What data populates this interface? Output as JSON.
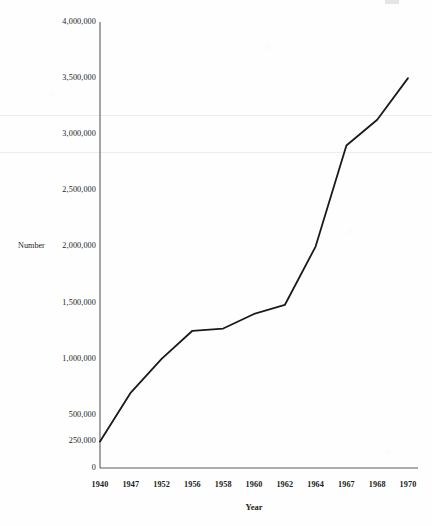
{
  "chart_data": {
    "type": "line",
    "title": "",
    "xlabel": "Year",
    "ylabel": "Number",
    "categories": [
      "1940",
      "1947",
      "1952",
      "1956",
      "1958",
      "1960",
      "1962",
      "1964",
      "1967",
      "1968",
      "1970"
    ],
    "values": [
      250000,
      700000,
      1000000,
      1250000,
      1270000,
      1400000,
      1480000,
      2000000,
      2900000,
      3130000,
      3500000
    ],
    "series": [
      {
        "name": "Number",
        "values": [
          250000,
          700000,
          1000000,
          1250000,
          1270000,
          1400000,
          1480000,
          2000000,
          2900000,
          3130000,
          3500000
        ]
      }
    ],
    "ylim": [
      0,
      4000000
    ],
    "ytick_values": [
      0,
      250000,
      500000,
      1000000,
      1500000,
      2000000,
      2500000,
      3000000,
      3500000,
      4000000
    ],
    "ytick_labels": [
      "0",
      "250,000",
      "500,000",
      "1,000,000",
      "1,500,000",
      "2,000,000",
      "2,500,000",
      "3,000,000",
      "3,500,000",
      "4,000,000"
    ],
    "xtick_labels": [
      "1940",
      "1947",
      "1952",
      "1956",
      "1958",
      "1960",
      "1962",
      "1964",
      "1967",
      "1968",
      "1970"
    ],
    "grid": false,
    "legend": false,
    "legend_position": "none",
    "line_color": "#1a1a1a",
    "line_width": 1.8,
    "markers": false,
    "background_color": "#fefefe",
    "axis_color": "#5a5a5a"
  },
  "axes": {
    "y_title": "Number",
    "x_title": "Year"
  }
}
